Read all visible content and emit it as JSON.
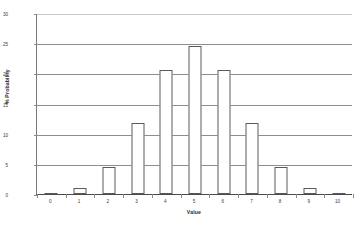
{
  "chart_data": {
    "type": "bar",
    "title": "",
    "xlabel": "Value",
    "ylabel": "% Probability",
    "categories": [
      "0",
      "1",
      "2",
      "3",
      "4",
      "5",
      "6",
      "7",
      "8",
      "9",
      "10"
    ],
    "values": [
      0.1,
      1.0,
      4.4,
      11.7,
      20.5,
      24.6,
      20.5,
      11.7,
      4.4,
      1.0,
      0.1
    ],
    "xlim": [
      0,
      10
    ],
    "ylim": [
      0,
      30
    ],
    "ytick_labels": [
      "30",
      "25",
      "20",
      "15",
      "10",
      "5",
      "0"
    ],
    "ytick_values": [
      30,
      25,
      20,
      15,
      10,
      5,
      0
    ],
    "xtick_labels": [
      "0",
      "1",
      "2",
      "3",
      "4",
      "5",
      "6",
      "7",
      "8",
      "9",
      "10"
    ],
    "grid": "horizontal",
    "legend": "none",
    "series": [
      {
        "name": "% Probability",
        "values": [
          0.1,
          1.0,
          4.4,
          11.7,
          20.5,
          24.6,
          20.5,
          11.7,
          4.4,
          1.0,
          0.1
        ]
      }
    ],
    "colors": {
      "bar_fill": "#ffffff",
      "bar_edge": "#5a5a5a",
      "gridline": "#8d8d8d",
      "axis": "#4a4a4a",
      "text": "#2e2e2e",
      "background": "#ffffff"
    }
  }
}
